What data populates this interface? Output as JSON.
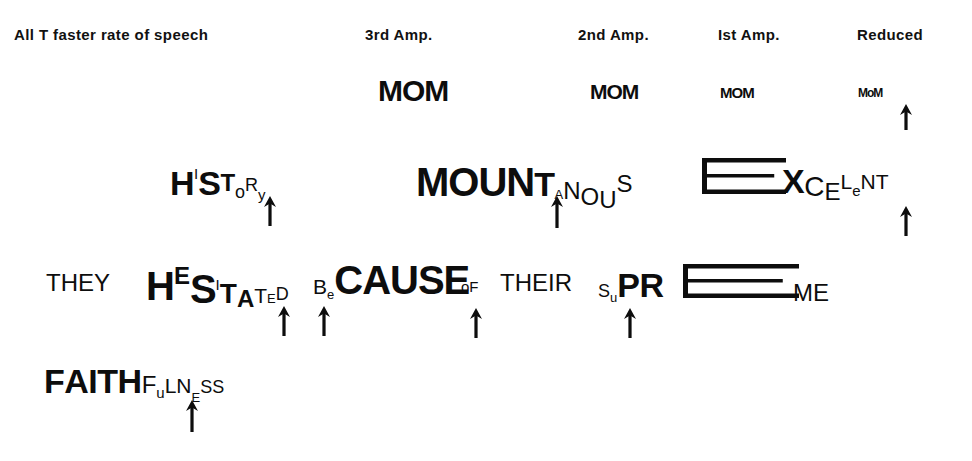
{
  "figure": {
    "title_row": [
      {
        "label": "All T faster rate of speech",
        "x": 14,
        "y": 26
      },
      {
        "label": "3rd Amp.",
        "x": 365,
        "y": 26
      },
      {
        "label": "2nd Amp.",
        "x": 578,
        "y": 26
      },
      {
        "label": "Ist Amp.",
        "x": 718,
        "y": 26
      },
      {
        "label": "Reduced",
        "x": 857,
        "y": 26
      }
    ],
    "mom_row": {
      "name": "mom-amplitude-series",
      "items": [
        {
          "text": "MOM",
          "x": 378,
          "y": 74,
          "size": 30
        },
        {
          "text": "MOM",
          "x": 590,
          "y": 80,
          "size": 21
        },
        {
          "text": "MOM",
          "x": 720,
          "y": 84,
          "size": 15
        },
        {
          "text": "MoM",
          "x": 858,
          "y": 86,
          "size": 12
        }
      ]
    },
    "words": [
      {
        "name": "word-history",
        "plain": "HISTORY",
        "x": 170,
        "y": 168,
        "letters": [
          {
            "ch": "H",
            "cls": "g2"
          },
          {
            "ch": "I",
            "cls": "g7 up16"
          },
          {
            "ch": "S",
            "cls": "g2"
          },
          {
            "ch": "T",
            "cls": "g4 up4"
          },
          {
            "ch": "o",
            "cls": "g6 dn3"
          },
          {
            "ch": "R",
            "cls": "g6 up4"
          },
          {
            "ch": "y",
            "cls": "g7 dn5"
          }
        ]
      },
      {
        "name": "word-mountainous",
        "plain": "MOUNTAiNOUS",
        "x": 416,
        "y": 164,
        "letters": [
          {
            "ch": "M",
            "cls": "g1"
          },
          {
            "ch": "O",
            "cls": "g1"
          },
          {
            "ch": "U",
            "cls": "g1"
          },
          {
            "ch": "N",
            "cls": "g1"
          },
          {
            "ch": "T",
            "cls": "g2"
          },
          {
            "ch": "A",
            "cls": "g8 dn3"
          },
          {
            "ch": "N",
            "cls": "g4 reg dn3"
          },
          {
            "ch": "O",
            "cls": "g4 thin dn9"
          },
          {
            "ch": "U",
            "cls": "g4 thin dn12"
          },
          {
            "ch": "S",
            "cls": "g4 thin up4"
          }
        ]
      },
      {
        "name": "word-excellent",
        "plain": "EXCELeNT",
        "x": 782,
        "y": 166,
        "letters": [
          {
            "ch": "X",
            "cls": "g2"
          },
          {
            "ch": "C",
            "cls": "g3 thin dn3"
          },
          {
            "ch": "E",
            "cls": "g4 thin dn7"
          },
          {
            "ch": "L",
            "cls": "g5 thin up4"
          },
          {
            "ch": "e",
            "cls": "g7 thin dn3"
          },
          {
            "ch": "N",
            "cls": "g5 reg up4"
          },
          {
            "ch": "T",
            "cls": "g5 reg up4"
          }
        ]
      },
      {
        "name": "word-they",
        "plain": "THEY",
        "x": 46,
        "y": 272,
        "letters": [
          {
            "ch": "T",
            "cls": "g4 thin"
          },
          {
            "ch": "H",
            "cls": "g4 thin"
          },
          {
            "ch": "E",
            "cls": "g4 thin"
          },
          {
            "ch": "Y",
            "cls": "g4 thin"
          }
        ]
      },
      {
        "name": "word-hesitated",
        "plain": "HESITATED",
        "x": 146,
        "y": 268,
        "letters": [
          {
            "ch": "H",
            "cls": "g1"
          },
          {
            "ch": "E",
            "cls": "g4 up16"
          },
          {
            "ch": "S",
            "cls": "g1 dn3"
          },
          {
            "ch": "I",
            "cls": "g7 up10"
          },
          {
            "ch": "T",
            "cls": "g3 dn3"
          },
          {
            "ch": "A",
            "cls": "g4 dn7"
          },
          {
            "ch": "T",
            "cls": "g5 dn3"
          },
          {
            "ch": "E",
            "cls": "g8 dn3"
          },
          {
            "ch": "D",
            "cls": "g6 thin"
          }
        ]
      },
      {
        "name": "word-because",
        "plain": "BeCAUSE",
        "x": 313,
        "y": 262,
        "letters": [
          {
            "ch": "B",
            "cls": "g5 reg"
          },
          {
            "ch": "e",
            "cls": "g8 dn5"
          },
          {
            "ch": "C",
            "cls": "g1"
          },
          {
            "ch": "A",
            "cls": "g1"
          },
          {
            "ch": "U",
            "cls": "g1"
          },
          {
            "ch": "S",
            "cls": "g1"
          },
          {
            "ch": "E",
            "cls": "g1"
          }
        ]
      },
      {
        "name": "word-of",
        "plain": "of",
        "x": 461,
        "y": 280,
        "letters": [
          {
            "ch": "o",
            "cls": "g7 thin"
          },
          {
            "ch": "F",
            "cls": "g7 thin"
          }
        ]
      },
      {
        "name": "word-their",
        "plain": "THEIR",
        "x": 500,
        "y": 272,
        "letters": [
          {
            "ch": "T",
            "cls": "g4 thin"
          },
          {
            "ch": "H",
            "cls": "g4 thin"
          },
          {
            "ch": "E",
            "cls": "g4 thin"
          },
          {
            "ch": "I",
            "cls": "g4 thin"
          },
          {
            "ch": "R",
            "cls": "g4 thin"
          }
        ]
      },
      {
        "name": "word-supreme",
        "plain": "SuPREME",
        "x": 598,
        "y": 270,
        "letters": [
          {
            "ch": "S",
            "cls": "g6 thin"
          },
          {
            "ch": "u",
            "cls": "g8 dn5"
          },
          {
            "ch": "P",
            "cls": "g2"
          },
          {
            "ch": "R",
            "cls": "g2"
          }
        ]
      },
      {
        "name": "word-supreme-tail",
        "plain": "ME",
        "x": 793,
        "y": 282,
        "letters": [
          {
            "ch": "M",
            "cls": "g4 reg"
          },
          {
            "ch": "E",
            "cls": "g4 reg"
          }
        ]
      },
      {
        "name": "word-faithfulness",
        "plain": "FAITHFuLNESS",
        "x": 44,
        "y": 366,
        "letters": [
          {
            "ch": "F",
            "cls": "g2"
          },
          {
            "ch": "A",
            "cls": "g2"
          },
          {
            "ch": "I",
            "cls": "g2"
          },
          {
            "ch": "T",
            "cls": "g2"
          },
          {
            "ch": "H",
            "cls": "g2"
          },
          {
            "ch": "F",
            "cls": "g4 thin"
          },
          {
            "ch": "u",
            "cls": "g7 dn5"
          },
          {
            "ch": "L",
            "cls": "g5 thin"
          },
          {
            "ch": "N",
            "cls": "g5 thin"
          },
          {
            "ch": "E",
            "cls": "g8 dn9"
          },
          {
            "ch": "S",
            "cls": "g6 thin"
          },
          {
            "ch": "S",
            "cls": "g6 thin"
          }
        ]
      }
    ],
    "arrows": [
      {
        "name": "arrow-mom-reduced",
        "x": 898,
        "y": 104,
        "h": 26
      },
      {
        "name": "arrow-history",
        "x": 262,
        "y": 196,
        "h": 30
      },
      {
        "name": "arrow-mountainous",
        "x": 549,
        "y": 196,
        "h": 32
      },
      {
        "name": "arrow-excellent",
        "x": 898,
        "y": 206,
        "h": 30
      },
      {
        "name": "arrow-hesitated-a",
        "x": 276,
        "y": 306,
        "h": 30
      },
      {
        "name": "arrow-hesitated-b",
        "x": 316,
        "y": 306,
        "h": 30
      },
      {
        "name": "arrow-because-of",
        "x": 468,
        "y": 308,
        "h": 30
      },
      {
        "name": "arrow-supreme",
        "x": 622,
        "y": 308,
        "h": 30
      },
      {
        "name": "arrow-faithfulness",
        "x": 184,
        "y": 400,
        "h": 32
      }
    ],
    "elongated_e": [
      {
        "name": "elongated-e-excellent",
        "x": 702,
        "y": 158,
        "w": 84,
        "h": 36
      },
      {
        "name": "elongated-e-supreme",
        "x": 683,
        "y": 264,
        "w": 116,
        "h": 34
      }
    ],
    "colors": {
      "ink": "#0d0d0d",
      "paper": "#ffffff"
    }
  }
}
